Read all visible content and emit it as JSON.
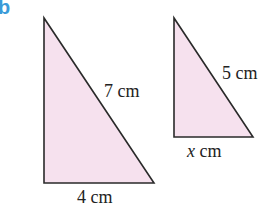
{
  "part_label": "b",
  "colors": {
    "fill": "#f6e1ee",
    "stroke": "#2a2a2a",
    "label_accent": "#3a9bd9"
  },
  "triangles": [
    {
      "name": "large",
      "hypotenuse": "7 cm",
      "base": "4 cm"
    },
    {
      "name": "small",
      "hypotenuse": "5 cm",
      "base_var": "x",
      "base_unit": " cm"
    }
  ]
}
